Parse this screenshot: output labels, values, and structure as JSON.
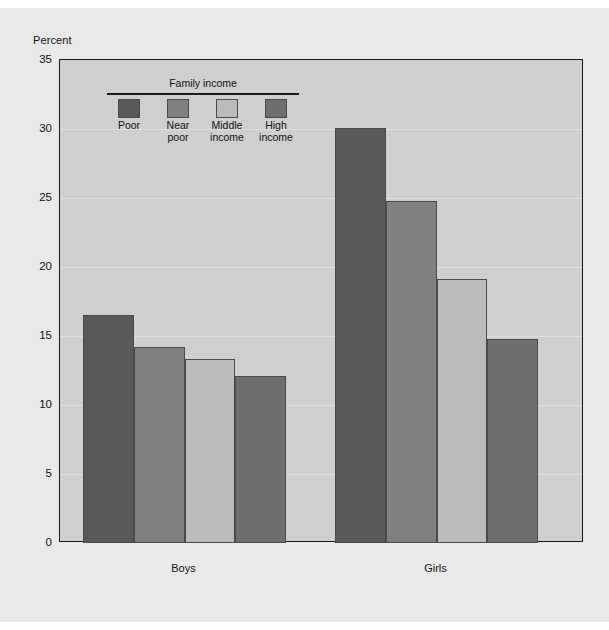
{
  "chart_data": {
    "type": "bar",
    "title": "",
    "xlabel": "",
    "ylabel": "Percent",
    "ylim": [
      0,
      35
    ],
    "yticks": [
      0,
      5,
      10,
      15,
      20,
      25,
      30,
      35
    ],
    "grid": true,
    "legend_title": "Family income",
    "legend_position": "upper-left-inside",
    "categories": [
      "Boys",
      "Girls"
    ],
    "series": [
      {
        "name": "Poor",
        "label": "Poor",
        "color": "#595959",
        "values": [
          16.5,
          30.1
        ]
      },
      {
        "name": "Near poor",
        "label": "Near\npoor",
        "color": "#808080",
        "values": [
          14.2,
          24.8
        ]
      },
      {
        "name": "Middle income",
        "label": "Middle\nincome",
        "color": "#bbbbbb",
        "values": [
          13.3,
          19.1
        ]
      },
      {
        "name": "High income",
        "label": "High\nincome",
        "color": "#6e6e6e",
        "values": [
          12.1,
          14.8
        ]
      }
    ]
  },
  "axis": {
    "y_title": "Percent",
    "tick_labels": [
      "35",
      "30",
      "25",
      "20",
      "15",
      "10",
      "5",
      "0"
    ],
    "group_labels": [
      "Boys",
      "Girls"
    ]
  },
  "legend": {
    "title": "Family income",
    "items": [
      {
        "label": "Poor",
        "color": "#595959"
      },
      {
        "label": "Near\npoor",
        "color": "#808080"
      },
      {
        "label": "Middle\nincome",
        "color": "#bbbbbb"
      },
      {
        "label": "High\nincome",
        "color": "#6e6e6e"
      }
    ]
  },
  "colors": {
    "page_background": "#ffffff",
    "panel_background": "#e9e9e9",
    "plot_background": "#cfcfcf",
    "gridline": "#dedede",
    "axis_line": "#1a1a1a",
    "text": "#111111"
  }
}
